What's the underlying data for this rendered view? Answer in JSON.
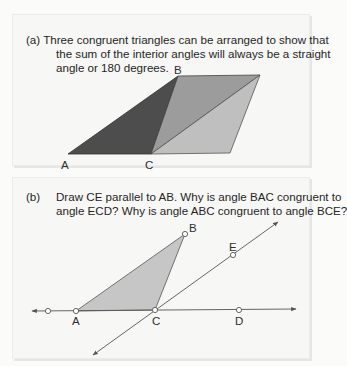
{
  "panel_a": {
    "label": "(a)",
    "caption_lines": [
      "Three congruent triangles can be arranged to show that",
      "the sum of the interior angles will always be a straight",
      "angle or 180 degrees."
    ],
    "points": {
      "A": "A",
      "B": "B",
      "C": "C"
    },
    "colors": {
      "dark_triangle": "#4a4a4a",
      "medium_triangle": "#9a9a9a",
      "light_triangle": "#bdbdbd"
    }
  },
  "panel_b": {
    "label": "(b)",
    "caption_lines": [
      "Draw CE parallel to AB. Why is angle BAC congruent to",
      "angle ECD? Why is angle ABC congruent to angle BCE?"
    ],
    "points": {
      "A": "A",
      "B": "B",
      "C": "C",
      "D": "D",
      "E": "E"
    },
    "colors": {
      "triangle_fill": "#c4c4c4",
      "line": "#555555"
    }
  }
}
